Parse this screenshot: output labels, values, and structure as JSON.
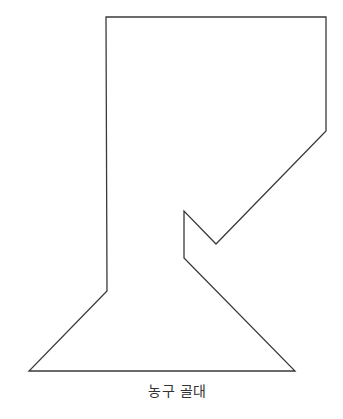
{
  "diagram": {
    "title": "농구 골대",
    "stroke_color": "#3a3a3a",
    "stroke_width": 1.3,
    "fill": "none",
    "outline_points": [
      [
        106,
        17
      ],
      [
        326,
        17
      ],
      [
        326,
        131
      ],
      [
        216,
        244
      ],
      [
        184,
        211
      ],
      [
        184,
        258
      ],
      [
        295,
        371
      ],
      [
        29,
        371
      ],
      [
        107,
        291
      ]
    ]
  },
  "caption": {
    "text": "농구 골대"
  }
}
